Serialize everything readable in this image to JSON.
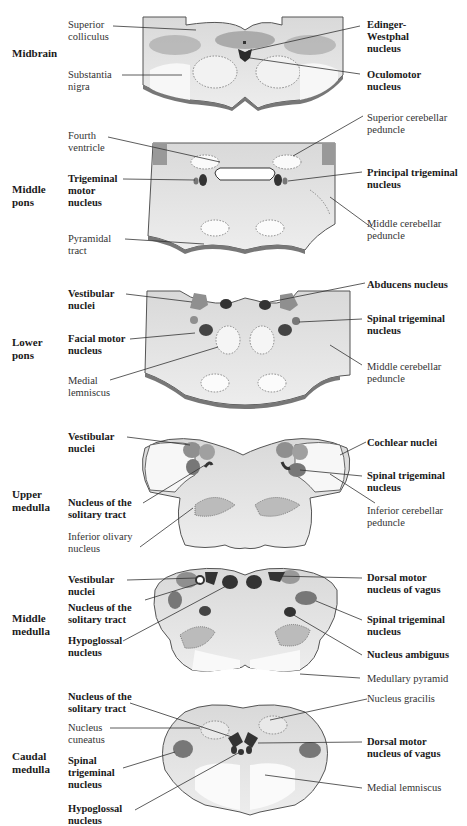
{
  "colors": {
    "tissue": "#e6e6e6",
    "tissue_light": "#f3f3f3",
    "tissue_dark": "#c9c9c9",
    "outline": "#555555",
    "nucleus_motor": "#3a3a3a",
    "nucleus_sensory": "#8f8f8f",
    "leader_line": "#333333"
  },
  "sections": [
    {
      "id": "midbrain",
      "level": "Midbrain",
      "labels_left": [
        {
          "text": "Superior\ncolliculus",
          "bold": false
        },
        {
          "text": "Substantia\nnigra",
          "bold": false
        }
      ],
      "labels_right": [
        {
          "text": "Edinger-\nWestphal\nnucleus",
          "bold": true
        },
        {
          "text": "Oculomotor\nnucleus",
          "bold": true
        }
      ]
    },
    {
      "id": "middle-pons",
      "level": "Middle\npons",
      "labels_left": [
        {
          "text": "Fourth\nventricle",
          "bold": false
        },
        {
          "text": "Trigeminal\nmotor\nnucleus",
          "bold": true
        },
        {
          "text": "Pyramidal\ntract",
          "bold": false
        }
      ],
      "labels_right": [
        {
          "text": "Superior cerebellar\npeduncle",
          "bold": false
        },
        {
          "text": "Principal trigeminal\nnucleus",
          "bold": true
        },
        {
          "text": "Middle cerebellar\npeduncle",
          "bold": false
        }
      ]
    },
    {
      "id": "lower-pons",
      "level": "Lower\npons",
      "labels_left": [
        {
          "text": "Vestibular\nnuclei",
          "bold": true
        },
        {
          "text": "Facial motor\nnucleus",
          "bold": true
        },
        {
          "text": "Medial\nlemniscus",
          "bold": false
        }
      ],
      "labels_right": [
        {
          "text": "Abducens nucleus",
          "bold": true
        },
        {
          "text": "Spinal trigeminal\nnucleus",
          "bold": true
        },
        {
          "text": "Middle cerebellar\npeduncle",
          "bold": false
        }
      ]
    },
    {
      "id": "upper-medulla",
      "level": "Upper\nmedulla",
      "labels_left": [
        {
          "text": "Vestibular\nnuclei",
          "bold": true
        },
        {
          "text": "Nucleus of the\nsolitary tract",
          "bold": true
        },
        {
          "text": "Inferior olivary\nnucleus",
          "bold": false
        }
      ],
      "labels_right": [
        {
          "text": "Cochlear nuclei",
          "bold": true
        },
        {
          "text": "Spinal trigeminal\nnucleus",
          "bold": true
        },
        {
          "text": "Inferior cerebellar\npeduncle",
          "bold": false
        }
      ]
    },
    {
      "id": "middle-medulla",
      "level": "Middle\nmedulla",
      "labels_left": [
        {
          "text": "Vestibular\nnuclei",
          "bold": true
        },
        {
          "text": "Nucleus of the\nsolitary tract",
          "bold": true
        },
        {
          "text": "Hypoglossal\nnucleus",
          "bold": true
        }
      ],
      "labels_right": [
        {
          "text": "Dorsal motor\nnucleus of vagus",
          "bold": true
        },
        {
          "text": "Spinal trigeminal\nnucleus",
          "bold": true
        },
        {
          "text": "Nucleus ambiguus",
          "bold": true
        },
        {
          "text": "Medullary pyramid",
          "bold": false
        }
      ]
    },
    {
      "id": "caudal-medulla",
      "level": "Caudal\nmedulla",
      "labels_left": [
        {
          "text": "Nucleus of the\nsolitary tract",
          "bold": true
        },
        {
          "text": "Nucleus\ncuneatus",
          "bold": false
        },
        {
          "text": "Spinal\ntrigeminal\nnucleus",
          "bold": true
        },
        {
          "text": "Hypoglossal\nnucleus",
          "bold": true
        }
      ],
      "labels_right": [
        {
          "text": "Nucleus gracilis",
          "bold": false
        },
        {
          "text": "Dorsal motor\nnucleus of vagus",
          "bold": true
        },
        {
          "text": "Medial lemniscus",
          "bold": false
        }
      ]
    }
  ]
}
